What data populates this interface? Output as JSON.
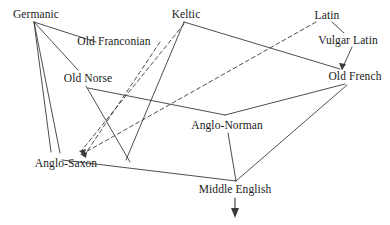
{
  "diagram": {
    "type": "node-link-diagram",
    "width": 390,
    "height": 225,
    "background_color": "#ffffff",
    "line_color": "#3a3a3a",
    "text_color": "#1a1a1a",
    "nodes": [
      {
        "id": "germanic",
        "label": "Germanic",
        "x": 36,
        "y": 14
      },
      {
        "id": "old_franconian",
        "label": "Old Franconian",
        "x": 114,
        "y": 41
      },
      {
        "id": "keltic",
        "label": "Keltic",
        "x": 186,
        "y": 14
      },
      {
        "id": "latin",
        "label": "Latin",
        "x": 327,
        "y": 15
      },
      {
        "id": "vulgar_latin",
        "label": "Vulgar Latin",
        "x": 348,
        "y": 40
      },
      {
        "id": "old_norse",
        "label": "Old Norse",
        "x": 88,
        "y": 78
      },
      {
        "id": "old_french",
        "label": "Old French",
        "x": 355,
        "y": 76
      },
      {
        "id": "anglo_norman",
        "label": "Anglo-Norman",
        "x": 227,
        "y": 125
      },
      {
        "id": "anglo_saxon",
        "label": "Anglo-Saxon",
        "x": 66,
        "y": 163
      },
      {
        "id": "middle_english",
        "label": "Middle English",
        "x": 235,
        "y": 189
      }
    ],
    "solid_edges": [
      {
        "from": "germanic",
        "to": "old_franconian"
      },
      {
        "from": "germanic",
        "to": "old_norse"
      },
      {
        "from": "germanic",
        "to": "anglo_saxon_left"
      },
      {
        "from": "germanic",
        "to": "anglo_saxon_right"
      },
      {
        "from": "keltic",
        "to": "anglo_saxon_lower"
      },
      {
        "from": "keltic",
        "to": "old_french"
      },
      {
        "from": "latin",
        "to": "vulgar_latin"
      },
      {
        "from": "vulgar_latin",
        "to": "old_french"
      },
      {
        "from": "old_norse",
        "to": "anglo_norman_vertex"
      },
      {
        "from": "old_french",
        "to": "anglo_norman_vertex"
      },
      {
        "from": "anglo_norman",
        "to": "middle_english"
      },
      {
        "from": "anglo_saxon",
        "to": "middle_english"
      },
      {
        "from": "old_french",
        "to": "middle_english"
      }
    ],
    "dashed_edges": [
      {
        "from": "keltic",
        "to": "anglo_saxon",
        "style": "dashed",
        "arrow": true
      },
      {
        "from": "latin",
        "to": "anglo_saxon",
        "style": "dashed",
        "arrow": true
      },
      {
        "from": "old_franconian_area",
        "to": "anglo_saxon",
        "style": "dashed",
        "arrow": true
      }
    ],
    "terminal_arrow": {
      "from": "middle_english",
      "direction": "down",
      "label": ""
    }
  }
}
